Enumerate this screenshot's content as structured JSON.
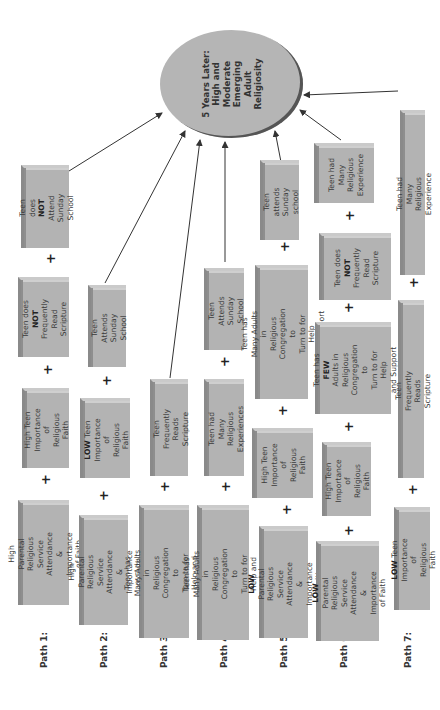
{
  "outcome": {
    "label": "5 Years Later:\nHigh and\nModerate\nEmerging\nAdult\nReligiosity"
  },
  "plus_symbol": "+",
  "paths": [
    {
      "label": "Path 1:",
      "factors": [
        {
          "pre": "",
          "bold": "",
          "post": "High Parental Religious\nService Attendance &\nImportance of Faith"
        },
        {
          "pre": "",
          "bold": "",
          "post": "High Teen\nImportance of\nReligious Faith"
        },
        {
          "pre": "Teen does ",
          "bold": "NOT",
          "post": "\nFrequently\nRead Scripture"
        },
        {
          "pre": "Teen does ",
          "bold": "NOT",
          "post": "\nAttend Sunday\nSchool"
        }
      ]
    },
    {
      "label": "Path 2:",
      "factors": [
        {
          "pre": "",
          "bold": "",
          "post": "High Parental Religious\nService Attendance &\nImportance of Faith"
        },
        {
          "pre": "",
          "bold": "LOW",
          "post": " Teen\nImportance of\nReligious Faith"
        },
        {
          "pre": "",
          "bold": "",
          "post": "Teen Attends\nSunday School"
        }
      ]
    },
    {
      "label": "Path 3:",
      "factors": [
        {
          "pre": "",
          "bold": "",
          "post": "Teen has Many Adults in\nReligious Congregation to\nTurn to for Help and Support"
        },
        {
          "pre": "",
          "bold": "",
          "post": "Teen Frequently\nReads Scripture"
        }
      ]
    },
    {
      "label": "Path 4:",
      "factors": [
        {
          "pre": "",
          "bold": "",
          "post": "Teen has Many Adults in\nReligious Congregation to\nTurn to for Help and Support"
        },
        {
          "pre": "",
          "bold": "",
          "post": "Teen had Many\nReligious Experiences"
        },
        {
          "pre": "",
          "bold": "",
          "post": "Teen Attends\nSunday School"
        }
      ]
    },
    {
      "label": "Path 5:",
      "factors": [
        {
          "pre": "",
          "bold": "LOW",
          "post": " Parental Religious\nService Attendance &\nImportance of Faith"
        },
        {
          "pre": "",
          "bold": "",
          "post": "High Teen\nImportance\nof Religious\nFaith"
        },
        {
          "pre": "",
          "bold": "",
          "post": "Teen has Many Adults in\nReligious Congregation to\nTurn to for Help\nand Support"
        },
        {
          "pre": "",
          "bold": "",
          "post": "Teen attends\nSunday school"
        }
      ]
    },
    {
      "label": "Path 6:",
      "factors": [
        {
          "pre": "",
          "bold": "LOW",
          "post": " Parental\nReligious Service\nAttendance &\nImportance of Faith"
        },
        {
          "pre": "",
          "bold": "",
          "post": "High Teen\nImportance of\nReligious Faith"
        },
        {
          "pre": "Teen has ",
          "bold": "FEW",
          "post": "\nAdults in Religious\nCongregation to\nTurn to for Help\nand Support"
        },
        {
          "pre": "Teen does\n",
          "bold": "NOT",
          "post": "\nFrequently\nRead\nScripture"
        },
        {
          "pre": "",
          "bold": "",
          "post": "Teen had\nMany\nReligious\nExperience"
        }
      ]
    },
    {
      "label": "Path 7:",
      "factors": [
        {
          "pre": "",
          "bold": "LOW",
          "post": " Teen Importance\nof Religious Faith"
        },
        {
          "pre": "",
          "bold": "",
          "post": "Teen Frequently Reads Scripture"
        },
        {
          "pre": "",
          "bold": "",
          "post": "Teen had Many Religious Experience"
        }
      ]
    }
  ],
  "colors": {
    "box_fill": "#b3b3b3",
    "box_side": "#8a8a8a",
    "box_top": "#cacaca",
    "ellipse_fill": "#b5b5b5",
    "arrow": "#333333",
    "text": "#3a3a3a"
  }
}
